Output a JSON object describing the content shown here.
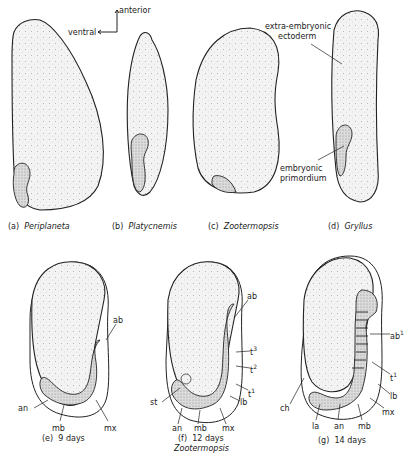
{
  "figure": {
    "orientation": {
      "anterior_label": "anterior",
      "ventral_label": "ventral"
    },
    "top_row": [
      {
        "id": "a",
        "letter": "(a)",
        "genus": "Periplaneta"
      },
      {
        "id": "b",
        "letter": "(b)",
        "genus": "Platycnemis"
      },
      {
        "id": "c",
        "letter": "(c)",
        "genus": "Zootermopsis"
      },
      {
        "id": "d",
        "letter": "(d)",
        "genus": "Gryllus"
      }
    ],
    "top_annotations": {
      "extra_embryonic_line1": "extra-embryonic",
      "extra_embryonic_line2": "ectoderm",
      "embryonic_line1": "embryonic",
      "embryonic_line2": "primordium"
    },
    "bottom_row": [
      {
        "id": "e",
        "letter": "(e)",
        "age": "9 days",
        "labels": {
          "ab": "ab",
          "an": "an",
          "mb": "mb",
          "mx": "mx"
        }
      },
      {
        "id": "f",
        "letter": "(f)",
        "age": "12 days",
        "genus": "Zootermopsis",
        "labels": {
          "ab": "ab",
          "t3": "t",
          "t3_sup": "3",
          "t2": "t",
          "t2_sup": "2",
          "t1": "t",
          "t1_sup": "1",
          "lb": "lb",
          "st": "st",
          "an": "an",
          "mb": "mb",
          "mx": "mx"
        }
      },
      {
        "id": "g",
        "letter": "(g)",
        "age": "14 days",
        "labels": {
          "ab1": "ab",
          "ab1_sup": "1",
          "t1": "t",
          "t1_sup": "1",
          "lb": "lb",
          "mx": "mx",
          "ch": "ch",
          "la": "la",
          "an": "an",
          "mb": "mb"
        }
      }
    ],
    "colors": {
      "ink": "#222222",
      "yolk_fill": "#efefef",
      "embryo_fill": "#d6d6d6",
      "background": "#ffffff"
    }
  }
}
